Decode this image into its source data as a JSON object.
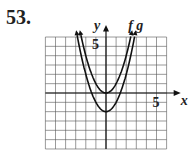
{
  "problem_number": "53.",
  "graph": {
    "x_label": "x",
    "y_label": "y",
    "x_tick_label": "5",
    "y_tick_label": "5",
    "grid_range": {
      "x": [
        -6,
        6
      ],
      "y": [
        -6,
        6
      ]
    },
    "curves": [
      {
        "name": "f",
        "equation": "y = x^2",
        "vertex": [
          0,
          0
        ]
      },
      {
        "name": "g",
        "equation": "y = x^2 - 2",
        "vertex": [
          0,
          -2
        ]
      }
    ],
    "curve_labels": [
      "f",
      "g"
    ]
  }
}
